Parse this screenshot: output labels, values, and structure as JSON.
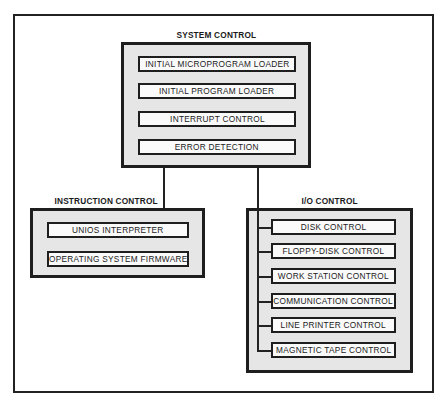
{
  "diagram": {
    "system_control": {
      "title": "SYSTEM CONTROL",
      "items": [
        "INITIAL MICROPROGRAM LOADER",
        "INITIAL PROGRAM LOADER",
        "INTERRUPT CONTROL",
        "ERROR DETECTION"
      ]
    },
    "instruction_control": {
      "title": "INSTRUCTION CONTROL",
      "items": [
        "UNIOS INTERPRETER",
        "OPERATING SYSTEM FIRMWARE"
      ]
    },
    "io_control": {
      "title": "I/O CONTROL",
      "items": [
        "DISK CONTROL",
        "FLOPPY-DISK CONTROL",
        "WORK STATION CONTROL",
        "COMMUNICATION CONTROL",
        "LINE PRINTER CONTROL",
        "MAGNETIC TAPE CONTROL"
      ]
    },
    "connections": [
      {
        "from": "SYSTEM CONTROL",
        "to": "INSTRUCTION CONTROL"
      },
      {
        "from": "SYSTEM CONTROL",
        "to": "I/O CONTROL"
      }
    ],
    "colors": {
      "line": "#1e1e1e",
      "group_fill": "#e6e6e6",
      "item_fill": "#fafafa",
      "background": "#ffffff"
    }
  }
}
